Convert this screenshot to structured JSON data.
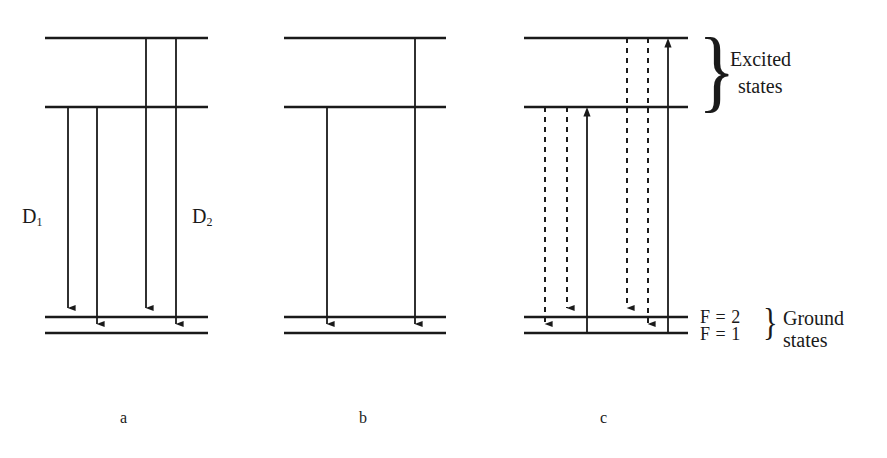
{
  "figure": {
    "caption_labels": {
      "panel_a": "a",
      "panel_b": "b",
      "panel_c": "c"
    },
    "transition_labels": {
      "d1_main": "D",
      "d1_sub": "1",
      "d2_main": "D",
      "d2_sub": "2"
    },
    "annotations": {
      "excited_states_line1": "Excited",
      "excited_states_line2": "states",
      "ground_states_line1": "Ground",
      "ground_states_line2": "states",
      "hyperfine_f2": "F = 2",
      "hyperfine_f1": "F = 1",
      "brace_excited": "}",
      "brace_ground": "}"
    },
    "colors": {
      "ink": "#1a1a1a",
      "background": "#ffffff"
    }
  },
  "chart_data": {
    "type": "diagram",
    "levels": [
      {
        "name": "excited-upper",
        "y": 38,
        "group": "excited"
      },
      {
        "name": "excited-lower",
        "y": 107,
        "group": "excited"
      },
      {
        "name": "ground-F2",
        "y": 317,
        "group": "ground",
        "label": "F = 2"
      },
      {
        "name": "ground-F1",
        "y": 333,
        "group": "ground",
        "label": "F = 1"
      }
    ],
    "panels": [
      {
        "id": "a",
        "label": "a",
        "level_x_start": 45,
        "level_x_end": 208,
        "label_x": 126,
        "transitions": [
          {
            "x": 68,
            "from_y": 107,
            "to_y": 317,
            "style": "solid",
            "direction": "down",
            "group": "D1"
          },
          {
            "x": 97,
            "from_y": 107,
            "to_y": 333,
            "style": "solid",
            "direction": "down",
            "group": "D1"
          },
          {
            "x": 146,
            "from_y": 38,
            "to_y": 317,
            "style": "solid",
            "direction": "down",
            "group": "D2"
          },
          {
            "x": 176,
            "from_y": 38,
            "to_y": 333,
            "style": "solid",
            "direction": "down",
            "group": "D2"
          }
        ]
      },
      {
        "id": "b",
        "label": "b",
        "level_x_start": 284,
        "level_x_end": 446,
        "label_x": 364,
        "transitions": [
          {
            "x": 327,
            "from_y": 107,
            "to_y": 333,
            "style": "solid",
            "direction": "down",
            "group": "D1"
          },
          {
            "x": 415,
            "from_y": 38,
            "to_y": 333,
            "style": "solid",
            "direction": "down",
            "group": "D2"
          }
        ]
      },
      {
        "id": "c",
        "label": "c",
        "level_x_start": 524,
        "level_x_end": 688,
        "label_x": 605,
        "transitions": [
          {
            "x": 545,
            "from_y": 107,
            "to_y": 333,
            "style": "dashed",
            "direction": "down",
            "group": "D1"
          },
          {
            "x": 567,
            "from_y": 107,
            "to_y": 317,
            "style": "dashed",
            "direction": "down",
            "group": "D1"
          },
          {
            "x": 587,
            "from_y": 333,
            "to_y": 107,
            "style": "solid",
            "direction": "up",
            "group": "D1-pump"
          },
          {
            "x": 627,
            "from_y": 38,
            "to_y": 317,
            "style": "dashed",
            "direction": "down",
            "group": "D2"
          },
          {
            "x": 648,
            "from_y": 38,
            "to_y": 333,
            "style": "dashed",
            "direction": "down",
            "group": "D2"
          },
          {
            "x": 668,
            "from_y": 333,
            "to_y": 38,
            "style": "solid",
            "direction": "up",
            "group": "D2-pump"
          }
        ]
      }
    ],
    "legend": [
      {
        "text": "D1",
        "x": 35,
        "y": 218
      },
      {
        "text": "D2",
        "x": 205,
        "y": 218
      }
    ]
  }
}
